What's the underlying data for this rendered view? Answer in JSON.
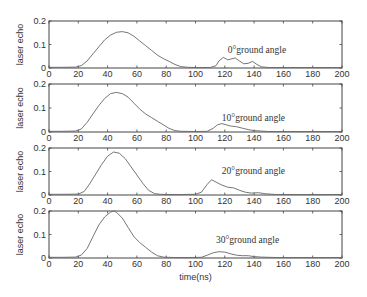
{
  "chart_data": [
    {
      "type": "line",
      "title": "",
      "xlabel": "",
      "ylabel": "laser echo",
      "xlim": [
        0,
        200
      ],
      "ylim": [
        0,
        0.2
      ],
      "xticks": [
        0,
        20,
        40,
        60,
        80,
        100,
        120,
        140,
        160,
        180,
        200
      ],
      "yticks": [
        0,
        0.1,
        0.2
      ],
      "annotation": {
        "text": "0°ground angle",
        "x": 122,
        "y": 0.065
      },
      "series": [
        {
          "name": "0° ground angle",
          "x": [
            0,
            10,
            18,
            22,
            26,
            30,
            34,
            38,
            42,
            46,
            50,
            54,
            58,
            62,
            66,
            70,
            74,
            78,
            82,
            86,
            90,
            95,
            100,
            110,
            114,
            116,
            119,
            122,
            124,
            127,
            130,
            133,
            136,
            139,
            142,
            145,
            150,
            160,
            180,
            200
          ],
          "y": [
            0.003,
            0.003,
            0.004,
            0.01,
            0.03,
            0.06,
            0.09,
            0.12,
            0.14,
            0.152,
            0.155,
            0.15,
            0.135,
            0.115,
            0.095,
            0.075,
            0.055,
            0.04,
            0.028,
            0.015,
            0.006,
            0.003,
            0.002,
            0.002,
            0.01,
            0.03,
            0.045,
            0.035,
            0.038,
            0.043,
            0.03,
            0.018,
            0.02,
            0.028,
            0.015,
            0.005,
            0.002,
            0.002,
            0.002,
            0.002
          ]
        }
      ]
    },
    {
      "type": "line",
      "xlabel": "",
      "ylabel": "laser echo",
      "xlim": [
        0,
        200
      ],
      "ylim": [
        0,
        0.2
      ],
      "xticks": [
        0,
        20,
        40,
        60,
        80,
        100,
        120,
        140,
        160,
        180,
        200
      ],
      "yticks": [
        0,
        0.1,
        0.2
      ],
      "annotation": {
        "text": "10°ground angle",
        "x": 118,
        "y": 0.045
      },
      "series": [
        {
          "name": "10° ground angle",
          "x": [
            0,
            10,
            18,
            22,
            26,
            30,
            34,
            38,
            42,
            46,
            50,
            54,
            58,
            62,
            66,
            70,
            74,
            78,
            82,
            86,
            90,
            100,
            108,
            112,
            115,
            118,
            121,
            124,
            128,
            132,
            136,
            140,
            144,
            150,
            160,
            180,
            200
          ],
          "y": [
            0.003,
            0.003,
            0.004,
            0.012,
            0.04,
            0.075,
            0.11,
            0.14,
            0.16,
            0.165,
            0.16,
            0.145,
            0.12,
            0.095,
            0.075,
            0.06,
            0.045,
            0.03,
            0.015,
            0.006,
            0.003,
            0.002,
            0.003,
            0.015,
            0.03,
            0.035,
            0.03,
            0.025,
            0.022,
            0.016,
            0.01,
            0.006,
            0.004,
            0.002,
            0.002,
            0.002,
            0.002
          ]
        }
      ]
    },
    {
      "type": "line",
      "xlabel": "",
      "ylabel": "laser echo",
      "xlim": [
        0,
        200
      ],
      "ylim": [
        0,
        0.2
      ],
      "xticks": [
        0,
        20,
        40,
        60,
        80,
        100,
        120,
        140,
        160,
        180,
        200
      ],
      "yticks": [
        0,
        0.1,
        0.2
      ],
      "annotation": {
        "text": "20°ground angle",
        "x": 118,
        "y": 0.09
      },
      "series": [
        {
          "name": "20° ground angle",
          "x": [
            0,
            10,
            20,
            24,
            28,
            32,
            36,
            40,
            44,
            48,
            52,
            56,
            60,
            64,
            68,
            72,
            76,
            80,
            90,
            100,
            104,
            108,
            111,
            114,
            118,
            122,
            126,
            130,
            134,
            138,
            143,
            148,
            155,
            170,
            200
          ],
          "y": [
            0.003,
            0.003,
            0.004,
            0.015,
            0.05,
            0.09,
            0.13,
            0.165,
            0.183,
            0.178,
            0.155,
            0.12,
            0.085,
            0.05,
            0.02,
            0.006,
            0.003,
            0.002,
            0.002,
            0.003,
            0.012,
            0.045,
            0.065,
            0.055,
            0.042,
            0.033,
            0.03,
            0.02,
            0.012,
            0.008,
            0.01,
            0.005,
            0.002,
            0.002,
            0.002
          ]
        }
      ]
    },
    {
      "type": "line",
      "xlabel": "time(ns)",
      "ylabel": "laser echo",
      "xlim": [
        0,
        200
      ],
      "ylim": [
        0,
        0.2
      ],
      "xticks": [
        0,
        20,
        40,
        60,
        80,
        100,
        120,
        140,
        160,
        180,
        200
      ],
      "yticks": [
        0,
        0.1,
        0.2
      ],
      "annotation": {
        "text": "30°ground angle",
        "x": 114,
        "y": 0.065
      },
      "series": [
        {
          "name": "30° ground angle",
          "x": [
            0,
            10,
            18,
            22,
            26,
            30,
            34,
            38,
            42,
            44,
            46,
            50,
            54,
            58,
            62,
            66,
            70,
            74,
            78,
            85,
            95,
            104,
            108,
            112,
            116,
            120,
            124,
            128,
            132,
            136,
            140,
            145,
            155,
            170,
            200
          ],
          "y": [
            0.003,
            0.003,
            0.004,
            0.012,
            0.04,
            0.09,
            0.14,
            0.175,
            0.195,
            0.2,
            0.195,
            0.17,
            0.13,
            0.09,
            0.065,
            0.045,
            0.025,
            0.01,
            0.004,
            0.002,
            0.002,
            0.003,
            0.012,
            0.022,
            0.027,
            0.025,
            0.018,
            0.012,
            0.01,
            0.01,
            0.006,
            0.004,
            0.002,
            0.002,
            0.002
          ]
        }
      ]
    }
  ]
}
